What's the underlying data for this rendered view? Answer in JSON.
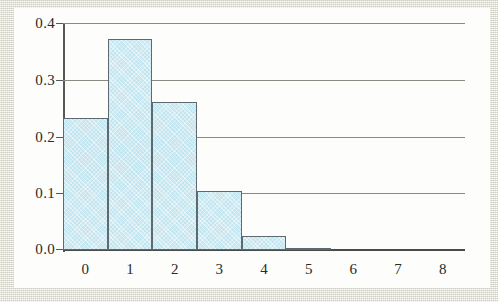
{
  "chart_data": {
    "type": "bar",
    "title": "",
    "subtitle": "",
    "xlabel": "",
    "ylabel": "",
    "categories": [
      "0",
      "1",
      "2",
      "3",
      "4",
      "5",
      "6",
      "7",
      "8"
    ],
    "values": [
      0.232,
      0.372,
      0.261,
      0.104,
      0.025,
      0.004,
      0.0,
      0.0,
      0.0
    ],
    "series": [
      {
        "name": "relative frequency",
        "values": [
          0.232,
          0.372,
          0.261,
          0.104,
          0.025,
          0.004,
          0.0,
          0.0,
          0.0
        ]
      }
    ],
    "ylim": [
      0.0,
      0.4
    ],
    "xlim": [
      -0.5,
      8.5
    ],
    "y_ticks": [
      "0.0",
      "0.1",
      "0.2",
      "0.3",
      "0.4"
    ],
    "y_tick_values": [
      0.0,
      0.1,
      0.2,
      0.3,
      0.4
    ],
    "x_ticks": [
      "0",
      "1",
      "2",
      "3",
      "4",
      "5",
      "6",
      "7",
      "8"
    ],
    "grid": "horizontal",
    "legend": "none",
    "annotations": [],
    "colors": {
      "bar_fill": "#c3e5ef",
      "bar_edge": "#5d6b70",
      "gridline": "#8a8a82",
      "axis": "#58585a",
      "baseline": "#4a4a46",
      "text": "#2a2a28",
      "page": "#fdfdfb",
      "frame": "#e6e6dc"
    }
  }
}
